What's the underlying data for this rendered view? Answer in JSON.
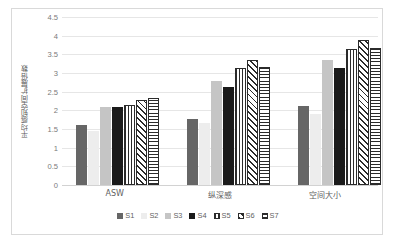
{
  "chart_data": {
    "type": "bar",
    "title": "",
    "xlabel": "",
    "ylabel": "平均感知空间扩展倍数",
    "categories": [
      "ASW",
      "纵深感",
      "空间大小"
    ],
    "ylim": [
      0,
      4.5
    ],
    "ytick_labels": [
      "4.5",
      "4",
      "3.5",
      "3",
      "2.5",
      "2",
      "1.5",
      "1",
      "0.5",
      "0"
    ],
    "ytick_values": [
      4.5,
      4,
      3.5,
      3,
      2.5,
      2,
      1.5,
      1,
      0.5,
      0
    ],
    "grid": true,
    "legend_position": "bottom",
    "series": [
      {
        "name": "S1",
        "values": [
          1.6,
          1.78,
          2.12
        ],
        "fill": "solid-dark-gray",
        "color": "#666666"
      },
      {
        "name": "S2",
        "values": [
          1.44,
          1.67,
          1.89
        ],
        "fill": "solid-very-light-gray",
        "color": "#ededed"
      },
      {
        "name": "S3",
        "values": [
          2.1,
          2.78,
          3.34
        ],
        "fill": "solid-light-gray",
        "color": "#c5c5c5"
      },
      {
        "name": "S4",
        "values": [
          2.1,
          2.63,
          3.13
        ],
        "fill": "solid-black",
        "color": "#1a1a1a"
      },
      {
        "name": "S5",
        "values": [
          2.15,
          3.14,
          3.63
        ],
        "fill": "vertical-lines",
        "color": "#2b2b2b"
      },
      {
        "name": "S6",
        "values": [
          2.27,
          3.36,
          3.89
        ],
        "fill": "diagonal-hatch",
        "color": "#2b2b2b"
      },
      {
        "name": "S7",
        "values": [
          2.33,
          3.17,
          3.66
        ],
        "fill": "horizontal-lines",
        "color": "#2b2b2b"
      }
    ]
  },
  "legend": {
    "items": [
      {
        "label": "S1"
      },
      {
        "label": "S2"
      },
      {
        "label": "S3"
      },
      {
        "label": "S4"
      },
      {
        "label": "S5"
      },
      {
        "label": "S6"
      },
      {
        "label": "S7"
      }
    ]
  }
}
